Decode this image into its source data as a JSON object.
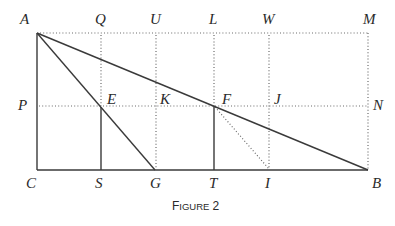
{
  "figure": {
    "caption_prefix": "F",
    "caption_smallcaps": "IGURE",
    "caption_number": "2",
    "caption": "FIGURE 2"
  },
  "points": {
    "A": {
      "label": "A",
      "x": 37,
      "y": 33
    },
    "Q": {
      "label": "Q",
      "x": 101,
      "y": 33
    },
    "U": {
      "label": "U",
      "x": 156,
      "y": 33
    },
    "L": {
      "label": "L",
      "x": 214,
      "y": 33
    },
    "W": {
      "label": "W",
      "x": 269,
      "y": 33
    },
    "M": {
      "label": "M",
      "x": 368,
      "y": 33
    },
    "P": {
      "label": "P",
      "x": 37,
      "y": 106
    },
    "E": {
      "label": "E",
      "x": 101,
      "y": 106
    },
    "K": {
      "label": "K",
      "x": 156,
      "y": 106
    },
    "F": {
      "label": "F",
      "x": 214,
      "y": 106
    },
    "J": {
      "label": "J",
      "x": 269,
      "y": 106
    },
    "N": {
      "label": "N",
      "x": 368,
      "y": 106
    },
    "C": {
      "label": "C",
      "x": 37,
      "y": 170
    },
    "S": {
      "label": "S",
      "x": 101,
      "y": 170
    },
    "G": {
      "label": "G",
      "x": 155,
      "y": 170
    },
    "T": {
      "label": "T",
      "x": 214,
      "y": 170
    },
    "I": {
      "label": "I",
      "x": 269,
      "y": 170
    },
    "B": {
      "label": "B",
      "x": 368,
      "y": 170
    }
  },
  "segments": {
    "solid": [
      "AC",
      "CB",
      "AB",
      "AG",
      "ES",
      "FT"
    ],
    "dotted": [
      "AM",
      "PN",
      "QE",
      "UG",
      "LF",
      "WI",
      "MB",
      "FI"
    ]
  },
  "colors": {
    "line": "#3a3a3a",
    "dotted": "#6a6a6a",
    "text": "#2a2a2a"
  }
}
